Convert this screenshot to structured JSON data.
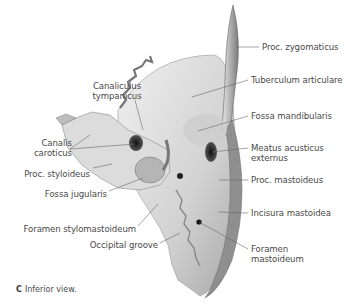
{
  "figure": {
    "view": "Inferior view",
    "caption_letter": "C",
    "caption_text": "Inferior view."
  },
  "labels": {
    "proc_zygomaticus": "Proc. zygomaticus",
    "tuberculum_articulare": "Tuberculum articulare",
    "fossa_mandibularis": "Fossa mandibularis",
    "meatus_line1": "Meatus acusticus",
    "meatus_line2": "externus",
    "proc_mastoideus": "Proc. mastoideus",
    "incisura_mastoidea": "Incisura mastoidea",
    "foramen_mastoideum_line1": "Foramen",
    "foramen_mastoideum_line2": "mastoideum",
    "canaliculus_line1": "Canaliculus",
    "canaliculus_line2": "tympanicus",
    "canalis_line1": "Canalis",
    "canalis_line2": "caroticus",
    "proc_styloideus": "Proc. styloideus",
    "fossa_jugularis": "Fossa jugularis",
    "foramen_stylomastoideum": "Foramen stylomastoideum",
    "occipital_groove": "Occipital groove"
  },
  "colors": {
    "bone_light": "#e6e6e6",
    "bone_mid": "#c4c4c4",
    "bone_dark": "#8a8a8a",
    "leader_line": "#6a6a6a",
    "text": "#4a4a4a"
  }
}
